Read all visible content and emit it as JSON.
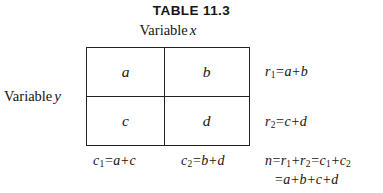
{
  "figure": {
    "title": "TABLE 11.3",
    "column_variable_caption": "Variable",
    "column_variable_symbol": "x",
    "row_variable_caption": "Variable",
    "row_variable_symbol": "y"
  },
  "table": {
    "type": "2x2-contingency-table",
    "cells": [
      {
        "id": "a",
        "label": "a",
        "row": 1,
        "col": 1
      },
      {
        "id": "b",
        "label": "b",
        "row": 1,
        "col": 2
      },
      {
        "id": "c",
        "label": "c",
        "row": 2,
        "col": 1
      },
      {
        "id": "d",
        "label": "d",
        "row": 2,
        "col": 2
      }
    ]
  },
  "row_totals": [
    {
      "id": "r1",
      "symbol": "r",
      "subscript": "1",
      "equals": "=",
      "expression": "a+b",
      "full": "r1=a+b"
    },
    {
      "id": "r2",
      "symbol": "r",
      "subscript": "2",
      "equals": "=",
      "expression": "c+d",
      "full": "r2=c+d"
    }
  ],
  "column_totals": [
    {
      "id": "c1",
      "symbol": "c",
      "subscript": "1",
      "equals": "=",
      "expression": "a+c",
      "full": "c1=a+c"
    },
    {
      "id": "c2",
      "symbol": "c",
      "subscript": "2",
      "equals": "=",
      "expression": "b+d",
      "full": "c2=b+d"
    }
  ],
  "grand_total": {
    "symbol": "n",
    "line1": "n=r1+r2=c1+c2",
    "line2": "=a+b+c+d"
  },
  "colors": {
    "background": "#ffffff",
    "ink": "#151515",
    "rule": "#222222"
  }
}
